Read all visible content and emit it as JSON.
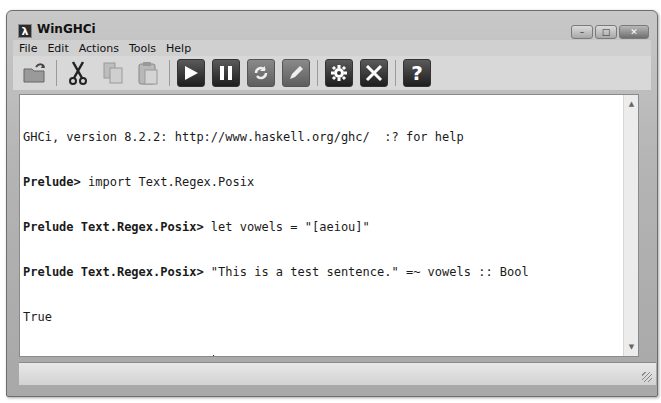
{
  "window": {
    "title": "WinGHCi",
    "app_icon_glyph": "λ",
    "controls": {
      "minimize": "–",
      "maximize": "□",
      "close": "✕"
    }
  },
  "menu": {
    "items": [
      {
        "label": "File"
      },
      {
        "label": "Edit"
      },
      {
        "label": "Actions"
      },
      {
        "label": "Tools"
      },
      {
        "label": "Help"
      }
    ]
  },
  "toolbar": {
    "buttons": [
      {
        "name": "open-icon",
        "glyph": "📂"
      },
      {
        "name": "cut-icon",
        "glyph": "✂"
      },
      {
        "name": "copy-icon",
        "glyph": "❐"
      },
      {
        "name": "paste-icon",
        "glyph": "📋"
      },
      {
        "name": "run-icon",
        "glyph": "▶"
      },
      {
        "name": "pause-icon",
        "glyph": "❚❚"
      },
      {
        "name": "reload-icon",
        "glyph": "⟳"
      },
      {
        "name": "edit-icon",
        "glyph": "✎"
      },
      {
        "name": "settings-icon",
        "glyph": "⚙"
      },
      {
        "name": "tools-icon",
        "glyph": "✕"
      },
      {
        "name": "help-icon",
        "glyph": "?"
      }
    ]
  },
  "console": {
    "lines": [
      {
        "prompt": "",
        "text": "GHCi, version 8.2.2: http://www.haskell.org/ghc/  :? for help"
      },
      {
        "prompt": "Prelude>",
        "text": " import Text.Regex.Posix"
      },
      {
        "prompt": "Prelude Text.Regex.Posix>",
        "text": " let vowels = \"[aeiou]\""
      },
      {
        "prompt": "Prelude Text.Regex.Posix>",
        "text": " \"This is a test sentence.\" =~ vowels :: Bool"
      },
      {
        "prompt": "",
        "text": "True"
      },
      {
        "prompt": "Prelude Text.Regex.Posix>",
        "text": " "
      }
    ]
  },
  "scrollbar": {
    "up": "▲",
    "down": "▼"
  }
}
